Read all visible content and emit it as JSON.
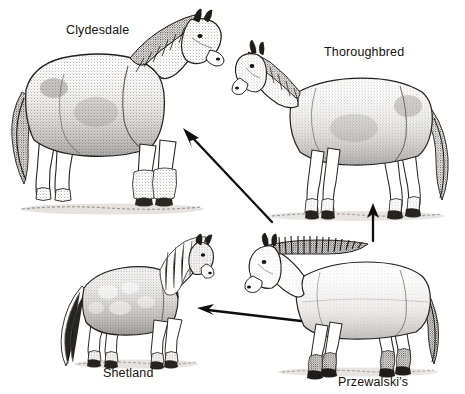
{
  "figure": {
    "background_color": "#ffffff",
    "ink_color": "#1a1a1a",
    "width": 465,
    "height": 394
  },
  "breeds": [
    {
      "id": "clydesdale",
      "label": "Clydesdale",
      "label_x": 66,
      "label_y": 24,
      "position": "top-left",
      "facing": "right",
      "build": "heavy draft horse with feathered legs and dark mane"
    },
    {
      "id": "thoroughbred",
      "label": "Thoroughbred",
      "label_x": 324,
      "label_y": 46,
      "position": "top-right",
      "facing": "left",
      "build": "tall slender riding horse with long legs"
    },
    {
      "id": "shetland",
      "label": "Shetland",
      "label_x": 103,
      "label_y": 367,
      "position": "bottom-left",
      "facing": "right",
      "build": "small stocky pony with long flowing mane and tail"
    },
    {
      "id": "przewalski",
      "label": "Przewalski's",
      "label_x": 338,
      "label_y": 376,
      "position": "bottom-right",
      "facing": "left",
      "build": "wild horse with erect bristly black mane and dark tail"
    }
  ],
  "arrows": [
    {
      "id": "przewalski-to-clydesdale",
      "from": "przewalski",
      "to": "clydesdale",
      "direction": "up-left diagonal",
      "x1": 272,
      "y1": 222,
      "x2": 185,
      "y2": 130
    },
    {
      "id": "przewalski-to-thoroughbred",
      "from": "przewalski",
      "to": "thoroughbred",
      "direction": "up vertical",
      "x1": 373,
      "y1": 241,
      "x2": 373,
      "y2": 205
    },
    {
      "id": "przewalski-to-shetland",
      "from": "przewalski",
      "to": "shetland",
      "direction": "left horizontal",
      "x1": 301,
      "y1": 321,
      "x2": 198,
      "y2": 309
    }
  ]
}
